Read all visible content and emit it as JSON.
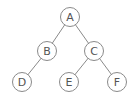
{
  "diagram": {
    "type": "binary-tree",
    "colors": {
      "stroke": "#8a8a8a",
      "text": "#555555",
      "fill": "#ffffff"
    },
    "nodes": [
      {
        "id": "A",
        "label": "A",
        "x": 70,
        "y": 17
      },
      {
        "id": "B",
        "label": "B",
        "x": 47,
        "y": 51
      },
      {
        "id": "C",
        "label": "C",
        "x": 94,
        "y": 51
      },
      {
        "id": "D",
        "label": "D",
        "x": 22,
        "y": 82
      },
      {
        "id": "E",
        "label": "E",
        "x": 69,
        "y": 82
      },
      {
        "id": "F",
        "label": "F",
        "x": 117,
        "y": 82
      }
    ],
    "edges": [
      {
        "from": "A",
        "to": "B"
      },
      {
        "from": "A",
        "to": "C"
      },
      {
        "from": "B",
        "to": "D"
      },
      {
        "from": "C",
        "to": "E"
      },
      {
        "from": "C",
        "to": "F"
      }
    ]
  }
}
